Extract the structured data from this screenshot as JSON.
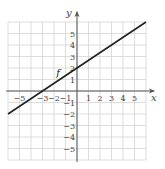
{
  "chart_data": {
    "type": "line",
    "title": "",
    "xlabel": "x",
    "ylabel": "y",
    "xlim": [
      -6,
      6
    ],
    "ylim": [
      -6,
      6
    ],
    "grid": true,
    "x_ticks": [
      -5,
      -3,
      -2,
      -1,
      1,
      2,
      3,
      4,
      5
    ],
    "x_tick_labels": [
      "−5",
      "−3",
      "−2",
      "−1",
      "1",
      "2",
      "3",
      "4",
      "5"
    ],
    "y_ticks": [
      5,
      4,
      3,
      2,
      1,
      -1,
      -2,
      -3,
      -4,
      -5
    ],
    "y_tick_labels": [
      "5",
      "4",
      "3",
      "2",
      "1",
      "−1",
      "−2",
      "−3",
      "−4",
      "−5"
    ],
    "series": [
      {
        "name": "f",
        "x": [
          -6,
          -3,
          0,
          6
        ],
        "y": [
          -2,
          0,
          2,
          6
        ],
        "equation": "f(x) = (2/3)x + 2"
      }
    ],
    "annotations": [
      {
        "text": "f",
        "x": -1.8,
        "y": 1.3
      }
    ]
  },
  "labels": {
    "x_axis": "x",
    "y_axis": "y",
    "function_name": "f"
  }
}
